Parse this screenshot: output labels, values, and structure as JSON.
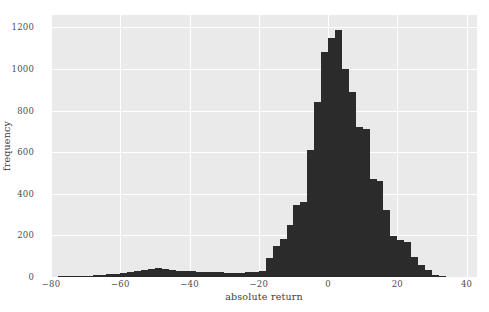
{
  "chart_data": {
    "type": "bar",
    "title": "",
    "subtitle": "",
    "xlabel": "absolute return",
    "ylabel": "frequency",
    "xlim": [
      -80,
      43
    ],
    "ylim": [
      0,
      1260
    ],
    "grid": true,
    "legend": null,
    "bin_width": 2,
    "plot_background": "#eaeaea",
    "bar_color": "#2b2b2b",
    "grid_color": "#ffffff",
    "xticks": [
      -80,
      -60,
      -40,
      -20,
      0,
      20,
      40
    ],
    "xtick_labels": [
      "−80",
      "−60",
      "−40",
      "−20",
      "0",
      "20",
      "40"
    ],
    "yticks": [
      0,
      200,
      400,
      600,
      800,
      1000,
      1200
    ],
    "ytick_labels": [
      "0",
      "200",
      "400",
      "600",
      "800",
      "1000",
      "1200"
    ],
    "x": [
      -77,
      -75,
      -73,
      -71,
      -69,
      -67,
      -65,
      -63,
      -61,
      -59,
      -57,
      -55,
      -53,
      -51,
      -49,
      -47,
      -45,
      -43,
      -41,
      -39,
      -37,
      -35,
      -33,
      -31,
      -29,
      -27,
      -25,
      -23,
      -21,
      -19,
      -17,
      -15,
      -13,
      -11,
      -9,
      -7,
      -5,
      -3,
      -1,
      1,
      3,
      5,
      7,
      9,
      11,
      13,
      15,
      17,
      19,
      21,
      23,
      25,
      27,
      29,
      31,
      33
    ],
    "values": [
      3,
      4,
      4,
      5,
      6,
      8,
      10,
      14,
      16,
      20,
      24,
      27,
      32,
      38,
      41,
      40,
      33,
      30,
      28,
      27,
      25,
      24,
      22,
      23,
      21,
      20,
      19,
      22,
      25,
      30,
      90,
      150,
      185,
      250,
      345,
      360,
      610,
      840,
      1080,
      1150,
      1190,
      1000,
      890,
      720,
      710,
      470,
      460,
      320,
      195,
      180,
      170,
      95,
      60,
      35,
      12,
      5
    ]
  },
  "axes": {
    "x_tick_label_0": "−80",
    "x_tick_label_1": "−60",
    "x_tick_label_2": "−40",
    "x_tick_label_3": "−20",
    "x_tick_label_4": "0",
    "x_tick_label_5": "20",
    "x_tick_label_6": "40",
    "y_tick_label_0": "0",
    "y_tick_label_1": "200",
    "y_tick_label_2": "400",
    "y_tick_label_3": "600",
    "y_tick_label_4": "800",
    "y_tick_label_5": "1000",
    "y_tick_label_6": "1200"
  }
}
